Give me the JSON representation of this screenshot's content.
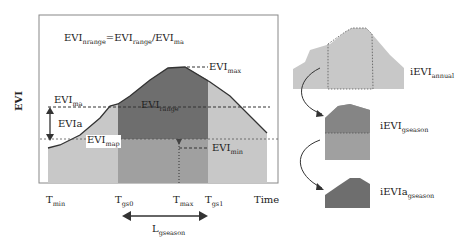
{
  "formula": {
    "main": "EVI",
    "sub1": "nrange",
    "eq": "=EVI",
    "sub2": "range",
    "div": "/EVI",
    "sub3": "ma"
  },
  "y_axis_label": "EVI",
  "x_axis_label": "Time",
  "labels": {
    "evi_max": {
      "main": "EVI",
      "sub": "max"
    },
    "evi_ma": {
      "main": "EVI",
      "sub": "ma"
    },
    "evi_range": {
      "main": "EVI",
      "sub": "range"
    },
    "evia": {
      "main": "EVIa"
    },
    "evi_map": {
      "main": "EVI",
      "sub": "map"
    },
    "evi_min": {
      "main": "EVI",
      "sub": "min"
    }
  },
  "x_ticks": [
    {
      "main": "T",
      "sub": "min"
    },
    {
      "main": "T",
      "sub": "gs0"
    },
    {
      "main": "T",
      "sub": "max"
    },
    {
      "main": "T",
      "sub": "gs1"
    }
  ],
  "season_length": {
    "main": "L",
    "sub": "gseason"
  },
  "right_panels": [
    {
      "main": "iEVI",
      "sub": "annual"
    },
    {
      "main": "iEVI",
      "sub": "gseason"
    },
    {
      "main": "iEVIa",
      "sub": "gseason"
    }
  ],
  "colors": {
    "light": "#c8c8c8",
    "mid": "#9a9a9a",
    "dark": "#6e6e6e",
    "line": "#444444"
  }
}
